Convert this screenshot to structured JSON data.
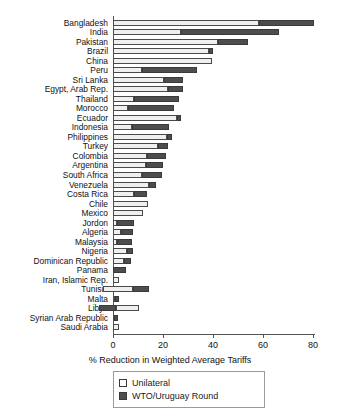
{
  "chart_data": {
    "type": "bar",
    "orientation": "horizontal-stacked",
    "title": "",
    "xlabel": "% Reduction in Weighted Average Tariffs",
    "ylabel": "",
    "xlim": [
      -8,
      84
    ],
    "xticks": [
      0,
      20,
      40,
      60,
      80
    ],
    "grid": false,
    "legend_position": "bottom-left",
    "categories": [
      "Bangladesh",
      "India",
      "Pakistan",
      "Brazil",
      "China",
      "Peru",
      "Sri Lanka",
      "Egypt, Arab Rep.",
      "Thailand",
      "Morocco",
      "Ecuador",
      "Indonesia",
      "Philippines",
      "Turkey",
      "Colombia",
      "Argentina",
      "South Africa",
      "Venezuela",
      "Costa Rica",
      "Chile",
      "Mexico",
      "Jordon",
      "Algeria",
      "Malaysia",
      "Nigeria",
      "Dominican Republic",
      "Panama",
      "Iran, Islamic Rep.",
      "Tunisia",
      "Malta",
      "Libya",
      "Syrian Arab Republic",
      "Saudi Arabia"
    ],
    "series": [
      {
        "name": "Unilateral",
        "color": "#efefef",
        "values": [
          58.5,
          27.0,
          42.0,
          38.5,
          39.5,
          11.5,
          20.5,
          22.0,
          8.5,
          6.0,
          25.5,
          7.5,
          21.5,
          18.0,
          13.5,
          13.0,
          11.5,
          14.5,
          8.5,
          14.0,
          12.0,
          1.5,
          3.0,
          1.5,
          5.5,
          4.5,
          0.0,
          2.5,
          12.0,
          0.8,
          9.5,
          0.4,
          2.5
        ]
      },
      {
        "name": "WTO/Uruguay Round",
        "color": "#4d4d4d",
        "values": [
          22.0,
          39.5,
          12.0,
          1.5,
          0.0,
          22.0,
          7.5,
          6.0,
          18.0,
          18.5,
          1.5,
          15.0,
          2.0,
          4.0,
          7.5,
          7.0,
          8.0,
          2.5,
          5.0,
          0.0,
          0.0,
          7.0,
          5.0,
          6.0,
          2.5,
          2.5,
          5.0,
          0.0,
          6.5,
          1.5,
          6.5,
          1.5,
          0.0
        ]
      }
    ],
    "series_offsets": {
      "Tunisia": -4.0,
      "Libya": -5.5
    },
    "bars": [
      {
        "country": "Bangladesh",
        "unilateral_start": 0,
        "unilateral_end": 58.5,
        "wto_start": 58.5,
        "wto_end": 80.5
      },
      {
        "country": "India",
        "unilateral_start": 0,
        "unilateral_end": 27.0,
        "wto_start": 27.0,
        "wto_end": 66.5
      },
      {
        "country": "Pakistan",
        "unilateral_start": 0,
        "unilateral_end": 42.0,
        "wto_start": 42.0,
        "wto_end": 54.0
      },
      {
        "country": "Brazil",
        "unilateral_start": 0,
        "unilateral_end": 38.5,
        "wto_start": 38.5,
        "wto_end": 40.0
      },
      {
        "country": "China",
        "unilateral_start": 0,
        "unilateral_end": 39.5,
        "wto_start": 39.5,
        "wto_end": 39.5
      },
      {
        "country": "Peru",
        "unilateral_start": 0,
        "unilateral_end": 11.5,
        "wto_start": 11.5,
        "wto_end": 33.5
      },
      {
        "country": "Sri Lanka",
        "unilateral_start": 0,
        "unilateral_end": 20.5,
        "wto_start": 20.5,
        "wto_end": 28.0
      },
      {
        "country": "Egypt, Arab Rep.",
        "unilateral_start": 0,
        "unilateral_end": 22.0,
        "wto_start": 22.0,
        "wto_end": 28.0
      },
      {
        "country": "Thailand",
        "unilateral_start": 0,
        "unilateral_end": 8.5,
        "wto_start": 8.5,
        "wto_end": 26.5
      },
      {
        "country": "Morocco",
        "unilateral_start": 0,
        "unilateral_end": 6.0,
        "wto_start": 6.0,
        "wto_end": 24.5
      },
      {
        "country": "Ecuador",
        "unilateral_start": 0,
        "unilateral_end": 25.5,
        "wto_start": 25.5,
        "wto_end": 27.0
      },
      {
        "country": "Indonesia",
        "unilateral_start": 0,
        "unilateral_end": 7.5,
        "wto_start": 7.5,
        "wto_end": 22.5
      },
      {
        "country": "Philippines",
        "unilateral_start": 0,
        "unilateral_end": 21.5,
        "wto_start": 21.5,
        "wto_end": 23.5
      },
      {
        "country": "Turkey",
        "unilateral_start": 0,
        "unilateral_end": 18.0,
        "wto_start": 18.0,
        "wto_end": 22.0
      },
      {
        "country": "Colombia",
        "unilateral_start": 0,
        "unilateral_end": 13.5,
        "wto_start": 13.5,
        "wto_end": 21.0
      },
      {
        "country": "Argentina",
        "unilateral_start": 0,
        "unilateral_end": 13.0,
        "wto_start": 13.0,
        "wto_end": 20.0
      },
      {
        "country": "South Africa",
        "unilateral_start": 0,
        "unilateral_end": 11.5,
        "wto_start": 11.5,
        "wto_end": 19.5
      },
      {
        "country": "Venezuela",
        "unilateral_start": 0,
        "unilateral_end": 14.5,
        "wto_start": 14.5,
        "wto_end": 17.0
      },
      {
        "country": "Costa Rica",
        "unilateral_start": 0,
        "unilateral_end": 8.5,
        "wto_start": 8.5,
        "wto_end": 13.5
      },
      {
        "country": "Chile",
        "unilateral_start": 0,
        "unilateral_end": 14.0,
        "wto_start": 14.0,
        "wto_end": 14.0
      },
      {
        "country": "Mexico",
        "unilateral_start": 0,
        "unilateral_end": 12.0,
        "wto_start": 12.0,
        "wto_end": 12.0
      },
      {
        "country": "Jordon",
        "unilateral_start": 0,
        "unilateral_end": 1.5,
        "wto_start": 1.5,
        "wto_end": 8.5
      },
      {
        "country": "Algeria",
        "unilateral_start": 0,
        "unilateral_end": 3.0,
        "wto_start": 3.0,
        "wto_end": 8.0
      },
      {
        "country": "Malaysia",
        "unilateral_start": 0,
        "unilateral_end": 1.5,
        "wto_start": 1.5,
        "wto_end": 7.5
      },
      {
        "country": "Nigeria",
        "unilateral_start": 0,
        "unilateral_end": 5.5,
        "wto_start": 5.5,
        "wto_end": 8.0
      },
      {
        "country": "Dominican Republic",
        "unilateral_start": 0,
        "unilateral_end": 4.5,
        "wto_start": 4.5,
        "wto_end": 7.0
      },
      {
        "country": "Panama",
        "unilateral_start": 0,
        "unilateral_end": 0.0,
        "wto_start": 0.0,
        "wto_end": 5.0
      },
      {
        "country": "Iran, Islamic Rep.",
        "unilateral_start": 0,
        "unilateral_end": 2.5,
        "wto_start": 2.5,
        "wto_end": 2.5
      },
      {
        "country": "Tunisia",
        "unilateral_start": -4.0,
        "unilateral_end": 8.0,
        "wto_start": 8.0,
        "wto_end": 14.5
      },
      {
        "country": "Malta",
        "unilateral_start": 0,
        "unilateral_end": 0.8,
        "wto_start": 0.8,
        "wto_end": 2.3
      },
      {
        "country": "Libya",
        "unilateral_start": 1.0,
        "unilateral_end": 10.5,
        "wto_start": -5.5,
        "wto_end": 1.0
      },
      {
        "country": "Syrian Arab Republic",
        "unilateral_start": 0,
        "unilateral_end": 0.4,
        "wto_start": 0.4,
        "wto_end": 1.9
      },
      {
        "country": "Saudi Arabia",
        "unilateral_start": 0,
        "unilateral_end": 2.5,
        "wto_start": 2.5,
        "wto_end": 2.5
      }
    ],
    "legend": [
      {
        "label": "Unilateral",
        "color": "#ffffff",
        "key": "unilateral"
      },
      {
        "label": "WTO/Uruguay Round",
        "color": "#4d4d4d",
        "key": "wto"
      }
    ]
  }
}
